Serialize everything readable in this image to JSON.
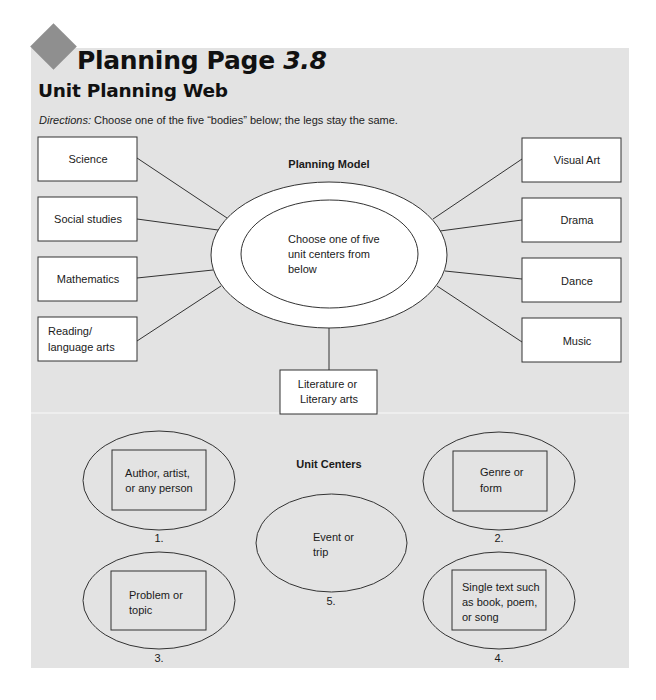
{
  "header": {
    "title": "Planning Page",
    "title_number": "3.8",
    "subtitle": "Unit Planning Web",
    "directions_lead": "Directions:",
    "directions_text": " Choose one of the five “bodies” below; the legs stay the same."
  },
  "colors": {
    "panel_bg": "#e3e3e3",
    "diamond": "#8f8f8f",
    "stroke": "#333333",
    "box_fill": "#ffffff"
  },
  "planning_model": {
    "heading": "Planning Model",
    "center_lines": [
      "Choose one of five",
      "unit centers from",
      "below"
    ],
    "left_legs": [
      {
        "lines": [
          "Science"
        ]
      },
      {
        "lines": [
          "Social studies"
        ]
      },
      {
        "lines": [
          "Mathematics"
        ]
      },
      {
        "lines": [
          "Reading/",
          "language arts"
        ]
      }
    ],
    "right_legs": [
      {
        "lines": [
          "Visual Art"
        ]
      },
      {
        "lines": [
          "Drama"
        ]
      },
      {
        "lines": [
          "Dance"
        ]
      },
      {
        "lines": [
          "Music"
        ]
      }
    ],
    "bottom_leg": {
      "lines": [
        "Literature or",
        "Literary arts"
      ]
    }
  },
  "unit_centers": {
    "heading": "Unit Centers",
    "items": [
      {
        "number": "1.",
        "lines": [
          "Author, artist,",
          "or any person"
        ]
      },
      {
        "number": "2.",
        "lines": [
          "Genre or",
          "form"
        ]
      },
      {
        "number": "3.",
        "lines": [
          "Problem or",
          "topic"
        ]
      },
      {
        "number": "4.",
        "lines": [
          "Single text such",
          "as book, poem,",
          "or song"
        ]
      },
      {
        "number": "5.",
        "lines": [
          "Event or",
          "trip"
        ]
      }
    ]
  }
}
